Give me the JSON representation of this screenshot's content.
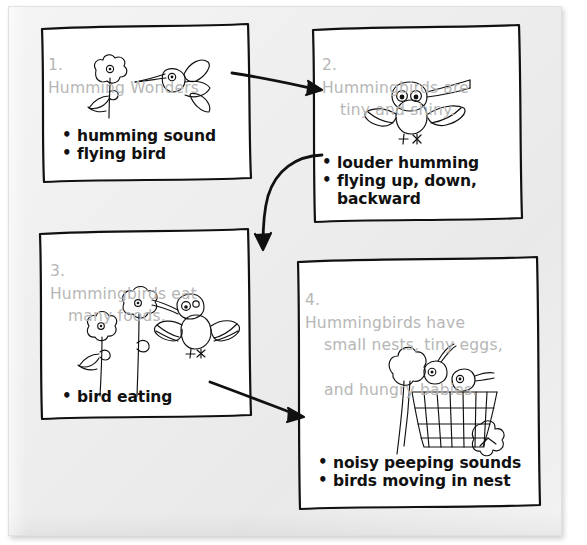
{
  "page": {
    "kind": "hand-drawn storyboard worksheet",
    "background_color": "#ffffff",
    "paper_color": "#efefef",
    "heading_color": "#b6b6b6",
    "ink_color": "#111111"
  },
  "panels": [
    {
      "id": "panel-1",
      "number": "1.",
      "heading": "Humming Wonders",
      "heading_lines": [
        "Humming Wonders"
      ],
      "sketch": "flower-and-hummingbird-sketch",
      "bullets": [
        "humming sound",
        "flying bird"
      ]
    },
    {
      "id": "panel-2",
      "number": "2.",
      "heading": "Hummingbirds are tiny and shiny.",
      "heading_lines": [
        "Hummingbirds are",
        "tiny and shiny."
      ],
      "sketch": "front-facing-hummingbird-sketch",
      "bullets": [
        "louder humming",
        "flying up, down,\nbackward"
      ]
    },
    {
      "id": "panel-3",
      "number": "3.",
      "heading": "Hummingbirds eat many foods.",
      "heading_lines": [
        "Hummingbirds eat",
        "many foods."
      ],
      "sketch": "bird-feeding-at-flowers-sketch",
      "bullets": [
        "bird eating"
      ]
    },
    {
      "id": "panel-4",
      "number": "4.",
      "heading": "Hummingbirds have small nests, tiny eggs, and hungry babies.",
      "heading_lines": [
        "Hummingbirds have",
        "small nests, tiny eggs,",
        "and hungry babies."
      ],
      "sketch": "nest-with-baby-birds-sketch",
      "bullets": [
        "noisy peeping sounds",
        "birds moving in nest"
      ]
    }
  ],
  "arrows": [
    {
      "id": "arrow-1-to-2",
      "from": "panel-1",
      "to": "panel-2",
      "style": "straight"
    },
    {
      "id": "arrow-2-to-3",
      "from": "panel-2",
      "to": "panel-3",
      "style": "curved"
    },
    {
      "id": "arrow-3-to-4",
      "from": "panel-3",
      "to": "panel-4",
      "style": "straight"
    }
  ]
}
